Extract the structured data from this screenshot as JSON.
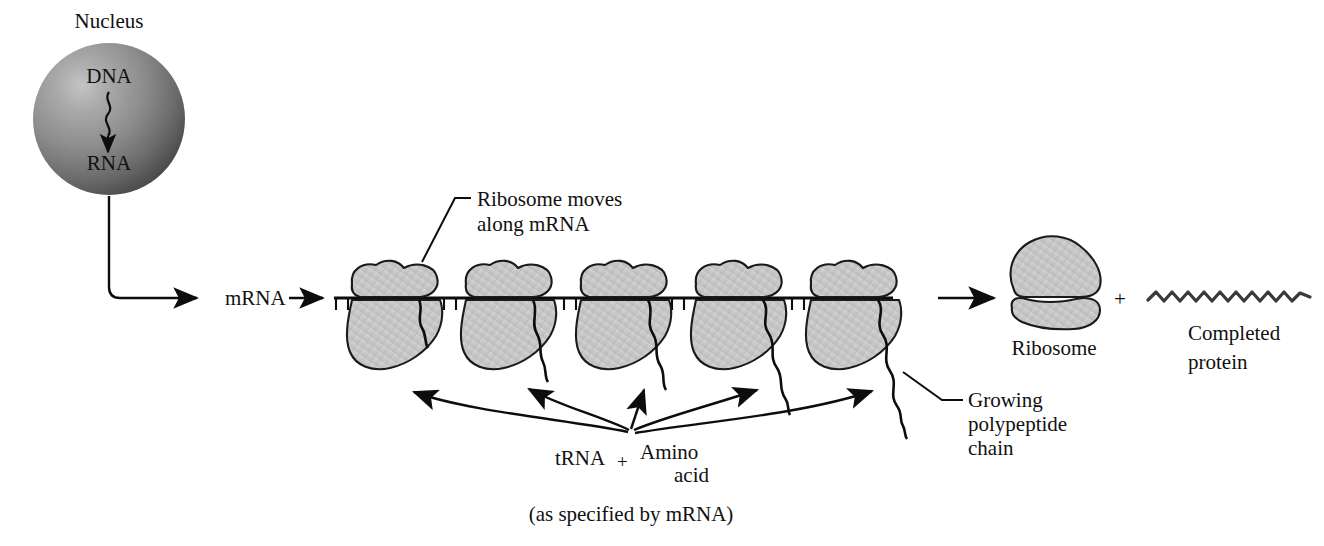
{
  "diagram": {
    "title_present": false,
    "labels": {
      "nucleus": "Nucleus",
      "dna": "DNA",
      "rna": "RNA",
      "mrna": "mRNA",
      "ribosome_moves_line1": "Ribosome moves",
      "ribosome_moves_line2": "along mRNA",
      "growing_line1": "Growing",
      "growing_line2": "polypeptide",
      "growing_line3": "chain",
      "trna": "tRNA",
      "plus_trna": "+",
      "amino": "Amino",
      "acid": "acid",
      "as_specified": "(as specified by mRNA)",
      "ribosome": "Ribosome",
      "plus_products": "+",
      "completed_line1": "Completed",
      "completed_line2": "protein"
    },
    "colors": {
      "ink": "#111111",
      "outline": "#1a1a1a",
      "blob_fill": "#c9c9c9",
      "blob_fill_light": "#d6d6d6",
      "nucleus_dark": "#4d4d4d",
      "nucleus_mid": "#8a8a8a",
      "nucleus_light": "#b9b9b9",
      "background": "#ffffff"
    },
    "nucleus": {
      "center_x": 109,
      "center_y": 119,
      "radius": 76
    },
    "mrna_strand": {
      "x_start": 334,
      "x_end": 893,
      "y": 298,
      "tick_count": 47,
      "tick_length": 12
    },
    "ribosomes_on_mrna": {
      "count": 5,
      "centers_x": [
        395,
        509,
        624,
        739,
        854
      ],
      "chain_lengths": [
        36,
        60,
        86,
        110,
        138
      ]
    },
    "free_ribosome": {
      "center_x": 1054,
      "large_lobe_y": 270,
      "small_lobe_y": 312
    },
    "completed_protein": {
      "x_start": 1148,
      "x_end": 1311,
      "y": 298,
      "peaks": 11
    },
    "trna_convergence": {
      "x": 631,
      "y": 436
    }
  }
}
